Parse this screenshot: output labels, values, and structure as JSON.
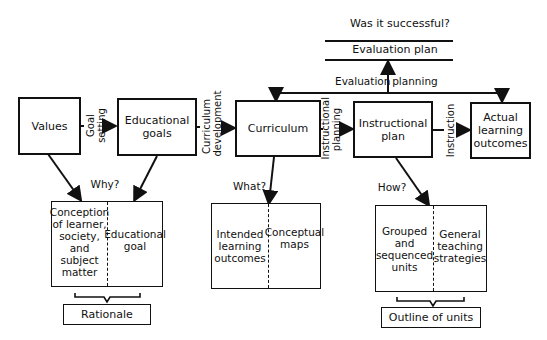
{
  "diagram": {
    "top": {
      "question": "Was it successful?",
      "evaluation_plan": "Evaluation plan",
      "evaluation_planning_left": "Evaluation",
      "evaluation_planning_right": "planning"
    },
    "main_boxes": {
      "values": "Values",
      "educational_goals": "Educational goals",
      "curriculum": "Curriculum",
      "instructional_plan": "Instructional plan",
      "actual_outcomes": "Actual learning outcomes"
    },
    "process_labels": {
      "goal_setting_1": "Goal",
      "goal_setting_2": "setting",
      "curriculum_development_1": "Curriculum",
      "curriculum_development_2": "development",
      "instructional_planning_1": "Instructional",
      "instructional_planning_2": "planning",
      "instruction": "Instruction"
    },
    "questions": {
      "why": "Why?",
      "what": "What?",
      "how": "How?"
    },
    "rationale_box": {
      "left": "Conception of learner, society, and subject matter",
      "right": "Educational goal",
      "summary": "Rationale"
    },
    "curriculum_box": {
      "left": "Intended learning outcomes",
      "right": "Conceptual maps"
    },
    "instruction_box": {
      "left": "Grouped and sequenced units",
      "right": "General teaching strategies",
      "summary": "Outline of units"
    }
  }
}
